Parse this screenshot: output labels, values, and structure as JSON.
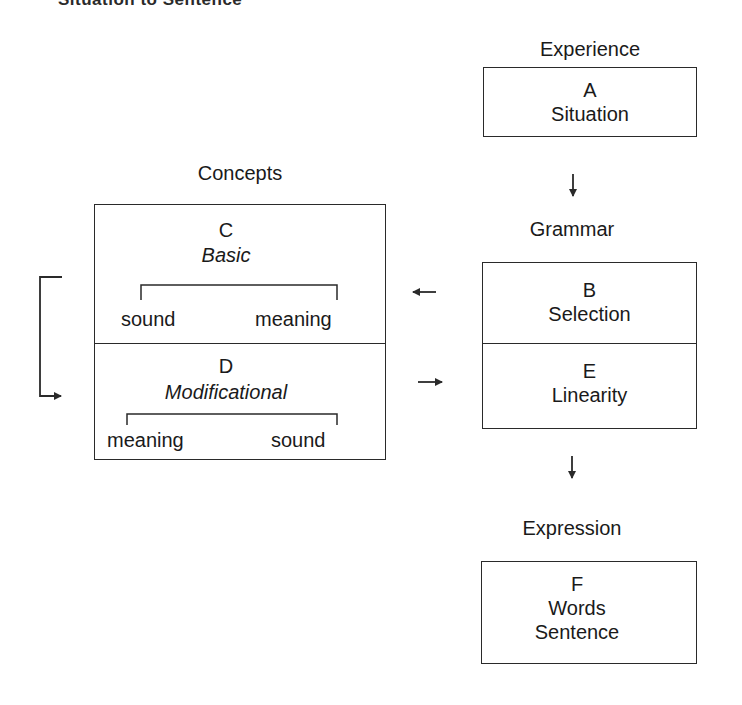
{
  "title": "Situation to Sentence",
  "experience": {
    "heading": "Experience",
    "box_a": {
      "letter": "A",
      "name": "Situation"
    }
  },
  "grammar": {
    "heading": "Grammar",
    "box_b": {
      "letter": "B",
      "name": "Selection"
    },
    "box_e": {
      "letter": "E",
      "name": "Linearity"
    }
  },
  "expression": {
    "heading": "Expression",
    "box_f": {
      "letter": "F",
      "line1": "Words",
      "line2": "Sentence"
    }
  },
  "concepts": {
    "heading": "Concepts",
    "box_c": {
      "letter": "C",
      "name": "Basic",
      "left": "sound",
      "right": "meaning"
    },
    "box_d": {
      "letter": "D",
      "name": "Modificational",
      "left": "meaning",
      "right": "sound"
    }
  },
  "arrows": {
    "a_to_grammar": "down-arrow",
    "b_to_c": "left-arrow",
    "d_to_e": "right-arrow",
    "e_to_expression": "down-arrow",
    "c_to_d_loop": "loop-arrow"
  }
}
